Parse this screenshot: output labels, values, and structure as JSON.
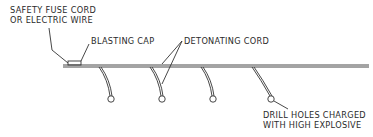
{
  "diagram": {
    "title": "",
    "labels": {
      "fuse_line1": "SAFETY FUSE CORD",
      "fuse_line2": "OR ELECTRIC WIRE",
      "blasting_cap": "BLASTING CAP",
      "detonating_cord": "DETONATING CORD",
      "drill_line1": "DRILL HOLES CHARGED",
      "drill_line2": "WITH HIGH EXPLOSIVE"
    },
    "components": [
      "safety fuse cord or electric wire",
      "blasting cap",
      "detonating cord (trunk line)",
      "4 downlines to drill holes",
      "drill holes charged with high explosive"
    ],
    "colors": {
      "line": "#333333",
      "background": "#ffffff"
    }
  }
}
